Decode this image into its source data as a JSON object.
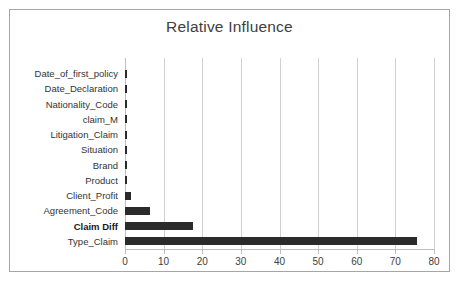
{
  "chart_data": {
    "type": "bar",
    "orientation": "horizontal",
    "title": "Relative Influence",
    "xlabel": "",
    "ylabel": "",
    "xlim": [
      0,
      80
    ],
    "xticks": [
      0,
      10,
      20,
      30,
      40,
      50,
      60,
      70,
      80
    ],
    "grid": true,
    "legend": false,
    "bar_color": "#2b2b2b",
    "gridline_color": "#d0d0d0",
    "border_color": "#a6a6a6",
    "categories": [
      "Date_of_first_policy",
      "Date_Declaration",
      "Nationality_Code",
      "claim_M",
      "Litigation_Claim",
      "Situation",
      "Brand",
      "Product",
      "Client_Profit",
      "Agreement_Code",
      "Claim Diff",
      "Type_Claim"
    ],
    "values": [
      0.4,
      0.4,
      0.5,
      0.4,
      0.5,
      0.5,
      0.5,
      0.6,
      1.5,
      6.5,
      17.5,
      75.5
    ],
    "emphasized_categories": [
      "Claim Diff"
    ]
  }
}
